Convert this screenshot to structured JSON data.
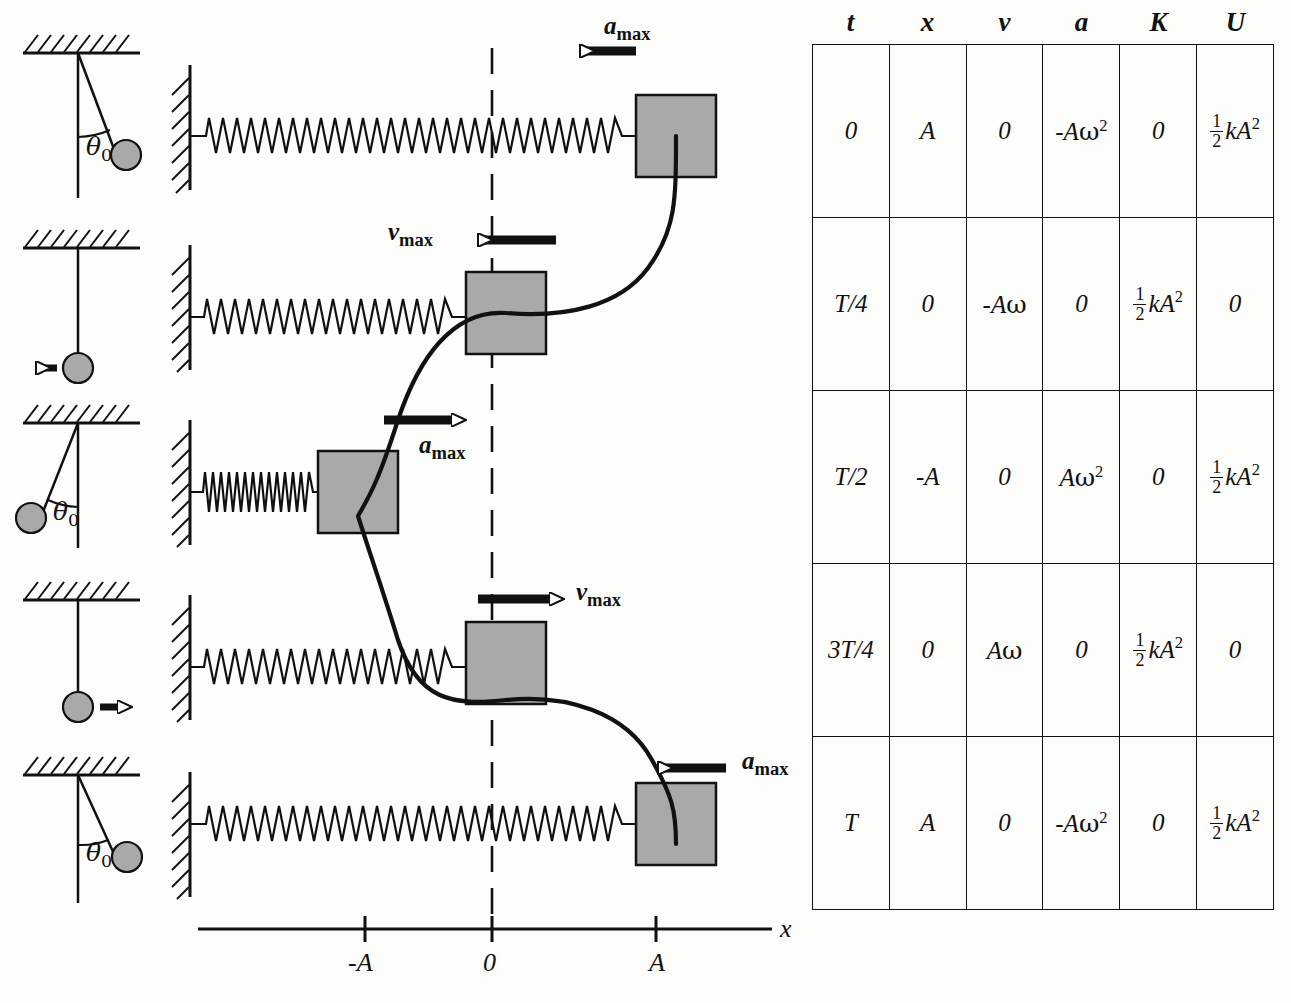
{
  "figure": {
    "axis": {
      "label": "x",
      "ticks": [
        {
          "label": "-A",
          "x": -1
        },
        {
          "label": "0",
          "x": 0
        },
        {
          "label": "A",
          "x": 1
        }
      ]
    },
    "colors": {
      "block_fill": "#a9a9a9",
      "line": "#111111",
      "background": "#fdfdfb",
      "spring": "#ffffff"
    },
    "snapshots": [
      {
        "time": "0",
        "position": "A",
        "spring_state": "stretched",
        "arrow": {
          "label_main": "a",
          "label_sub": "max",
          "direction": "left",
          "label_side": "above"
        }
      },
      {
        "time": "T/4",
        "position": "0",
        "spring_state": "natural",
        "arrow": {
          "label_main": "v",
          "label_sub": "max",
          "direction": "left",
          "label_side": "left"
        }
      },
      {
        "time": "T/2",
        "position": "-A",
        "spring_state": "compressed",
        "arrow": {
          "label_main": "a",
          "label_sub": "max",
          "direction": "right",
          "label_side": "below"
        }
      },
      {
        "time": "3T/4",
        "position": "0",
        "spring_state": "natural",
        "arrow": {
          "label_main": "v",
          "label_sub": "max",
          "direction": "right",
          "label_side": "right"
        }
      },
      {
        "time": "T",
        "position": "A",
        "spring_state": "stretched",
        "arrow": {
          "label_main": "a",
          "label_sub": "max",
          "direction": "left",
          "label_side": "right"
        }
      }
    ],
    "pendulums": [
      {
        "state": "displaced-right",
        "angle_label": "θ",
        "angle_sub": "0",
        "arrow": "none"
      },
      {
        "state": "vertical",
        "angle_label": "",
        "angle_sub": "",
        "arrow": "left"
      },
      {
        "state": "displaced-left",
        "angle_label": "θ",
        "angle_sub": "0",
        "arrow": "none"
      },
      {
        "state": "vertical",
        "angle_label": "",
        "angle_sub": "",
        "arrow": "right"
      },
      {
        "state": "displaced-right",
        "angle_label": "θ",
        "angle_sub": "0",
        "arrow": "none"
      }
    ]
  },
  "chart_data": {
    "type": "line",
    "xlabel": "x",
    "ylabel": "t",
    "orientation": "time-downward",
    "grid": false,
    "legend": null,
    "xlim": [
      -1.35,
      1.35
    ],
    "axis_ticks": [
      "-A",
      "0",
      "A"
    ],
    "series": [
      {
        "name": "x(t) = A cos(ωt)",
        "x": [
          1,
          0,
          -1,
          0,
          1
        ],
        "t": [
          "0",
          "T/4",
          "T/2",
          "3T/4",
          "T"
        ]
      }
    ]
  },
  "table": {
    "headers": [
      "t",
      "x",
      "v",
      "a",
      "K",
      "U"
    ],
    "rows": [
      {
        "t": "0",
        "x": "A",
        "v": "0",
        "a": {
          "sign": "-",
          "base": "A",
          "greek": "ω",
          "exp": "2"
        },
        "K": "0",
        "U": {
          "frac_num": "1",
          "frac_den": "2",
          "rest": "kA",
          "exp": "2"
        }
      },
      {
        "t": "T/4",
        "x": "0",
        "v": {
          "sign": "-",
          "base": "A",
          "greek": "ω",
          "exp": ""
        },
        "a": "0",
        "K": {
          "frac_num": "1",
          "frac_den": "2",
          "rest": "kA",
          "exp": "2"
        },
        "U": "0"
      },
      {
        "t": "T/2",
        "x": "-A",
        "v": "0",
        "a": {
          "sign": "",
          "base": "A",
          "greek": "ω",
          "exp": "2"
        },
        "K": "0",
        "U": {
          "frac_num": "1",
          "frac_den": "2",
          "rest": "kA",
          "exp": "2"
        }
      },
      {
        "t": "3T/4",
        "x": "0",
        "v": {
          "sign": "",
          "base": "A",
          "greek": "ω",
          "exp": ""
        },
        "a": "0",
        "K": {
          "frac_num": "1",
          "frac_den": "2",
          "rest": "kA",
          "exp": "2"
        },
        "U": "0"
      },
      {
        "t": "T",
        "x": "A",
        "v": "0",
        "a": {
          "sign": "-",
          "base": "A",
          "greek": "ω",
          "exp": "2"
        },
        "K": "0",
        "U": {
          "frac_num": "1",
          "frac_den": "2",
          "rest": "kA",
          "exp": "2"
        }
      }
    ]
  },
  "labels": {
    "a1_main": "a",
    "a1_sub": "max",
    "v2_main": "v",
    "v2_sub": "max",
    "a3_main": "a",
    "a3_sub": "max",
    "v4_main": "v",
    "v4_sub": "max",
    "a5_main": "a",
    "a5_sub": "max",
    "axis_x": "x",
    "tick_neg_a": "-A",
    "tick_zero": "0",
    "tick_pos_a": "A",
    "theta_glyph": "θ",
    "theta_sub": "0"
  }
}
